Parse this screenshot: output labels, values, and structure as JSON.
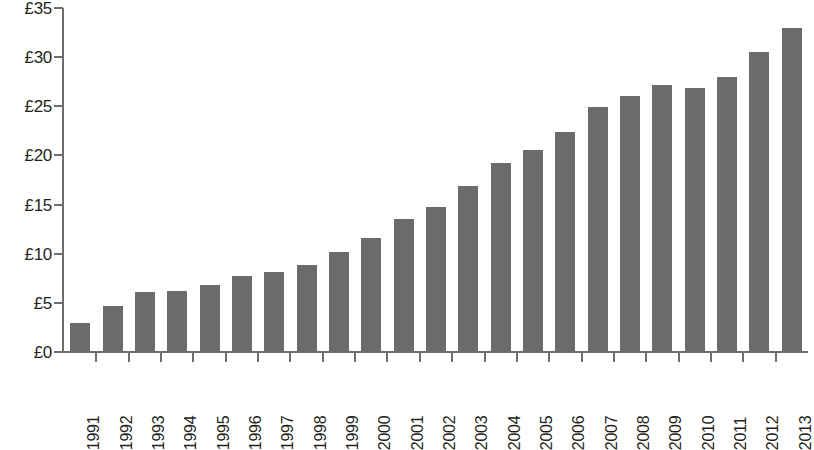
{
  "chart_data": {
    "type": "bar",
    "title": "",
    "subtitle": "",
    "xlabel": "",
    "ylabel": "",
    "categories": [
      "1991",
      "1992",
      "1993",
      "1994",
      "1995",
      "1996",
      "1997",
      "1998",
      "1999",
      "2000",
      "2001",
      "2002",
      "2003",
      "2004",
      "2005",
      "2006",
      "2007",
      "2008",
      "2009",
      "2010",
      "2011",
      "2012",
      "2013"
    ],
    "values": [
      3.0,
      4.7,
      6.1,
      6.2,
      6.8,
      7.7,
      8.1,
      8.9,
      10.2,
      11.6,
      13.5,
      14.8,
      16.9,
      19.2,
      20.6,
      22.4,
      24.9,
      26.0,
      27.2,
      26.9,
      28.0,
      30.5,
      33.0
    ],
    "ylim": [
      0,
      35
    ],
    "ytick_values": [
      0,
      5,
      10,
      15,
      20,
      25,
      30,
      35
    ],
    "ytick_labels": [
      "£0",
      "£5",
      "£10",
      "£15",
      "£20",
      "£25",
      "£30",
      "£35"
    ],
    "currency_symbol": "£",
    "grid": false,
    "legend": null,
    "series_name": "",
    "bar_color": "#6b6b6b",
    "axis_color": "#6e6e6e",
    "text_color": "#231f20",
    "background_color": "#ffffff",
    "xtick_label_rotation": 90
  }
}
